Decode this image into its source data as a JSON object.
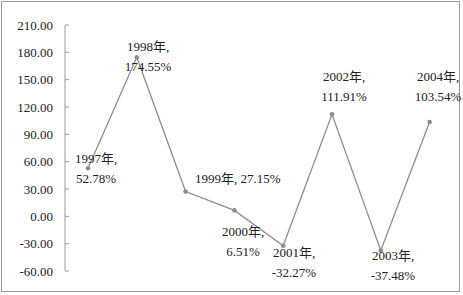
{
  "chart_data": {
    "type": "line",
    "title": "",
    "xlabel": "",
    "ylabel": "",
    "categories": [
      "1997年",
      "1998年",
      "1999年",
      "2000年",
      "2001年",
      "2002年",
      "2003年",
      "2004年"
    ],
    "values": [
      52.78,
      174.55,
      27.15,
      6.51,
      -32.27,
      111.91,
      -37.48,
      103.54
    ],
    "data_labels": [
      "1997年, 52.78%",
      "1998年, 174.55%",
      "1999年, 27.15%",
      "2000年, 6.51%",
      "2001年, -32.27%",
      "2002年, 111.91%",
      "2003年, -37.48%",
      "2004年, 103.54%"
    ],
    "y_ticks": [
      "210.00",
      "180.00",
      "150.00",
      "120.00",
      "90.00",
      "60.00",
      "30.00",
      "0.00",
      "-30.00",
      "-60.00"
    ],
    "ylim": [
      -60,
      210
    ],
    "grid": false,
    "legend": null,
    "series_color": "#8c8c8c"
  }
}
